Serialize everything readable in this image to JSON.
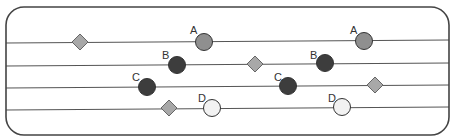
{
  "diagram": {
    "frame": {
      "x": 6,
      "y": 7,
      "w": 443,
      "h": 128,
      "rx": 18,
      "stroke": "#444444"
    },
    "lines": [
      {
        "y1": 43,
        "y2": 40
      },
      {
        "y1": 66,
        "y2": 63
      },
      {
        "y1": 88,
        "y2": 85
      },
      {
        "y1": 110,
        "y2": 107
      }
    ],
    "line_color": "#555555",
    "colors": {
      "A": "#8f8f8f",
      "B": "#3d3d3d",
      "C": "#3d3d3d",
      "D": "#f2f2f2",
      "diamond": "#a8a8a8"
    },
    "particles": [
      {
        "label": "A",
        "cx": 204,
        "cy": 42,
        "lx": 190,
        "ly": 34
      },
      {
        "label": "B",
        "cx": 177,
        "cy": 65,
        "lx": 162,
        "ly": 59
      },
      {
        "label": "C",
        "cx": 147,
        "cy": 87,
        "lx": 132,
        "ly": 81
      },
      {
        "label": "D",
        "cx": 212,
        "cy": 108,
        "lx": 198,
        "ly": 102
      },
      {
        "label": "A",
        "cx": 364,
        "cy": 41,
        "lx": 350,
        "ly": 34
      },
      {
        "label": "B",
        "cx": 325,
        "cy": 63,
        "lx": 310,
        "ly": 59
      },
      {
        "label": "C",
        "cx": 288,
        "cy": 86,
        "lx": 274,
        "ly": 81
      },
      {
        "label": "D",
        "cx": 342,
        "cy": 107,
        "lx": 328,
        "ly": 102
      }
    ],
    "diamonds": [
      {
        "cx": 80,
        "cy": 42
      },
      {
        "cx": 169,
        "cy": 108
      },
      {
        "cx": 255,
        "cy": 64
      },
      {
        "cx": 375,
        "cy": 85
      }
    ]
  }
}
